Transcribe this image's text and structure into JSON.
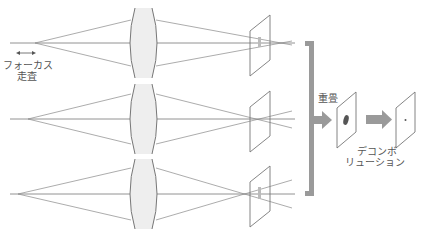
{
  "labels": {
    "focus_sweep_line1": "フォーカス",
    "focus_sweep_line2": "走査",
    "superposition": "重畳",
    "deconvolution_line1": "デコンボ",
    "deconvolution_line2": "リューション"
  },
  "colors": {
    "line": "#777777",
    "lens_fill": "#eeeeee",
    "bracket": "#9a9a9a",
    "arrow": "#9a9a9a",
    "blur": "#666666"
  },
  "rows": [
    {
      "name": "row-1",
      "axis_y": 43
    },
    {
      "name": "row-2",
      "axis_y": 119
    },
    {
      "name": "row-3",
      "axis_y": 194
    }
  ]
}
